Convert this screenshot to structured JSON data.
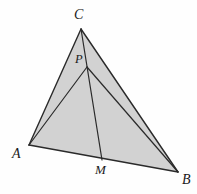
{
  "figure": {
    "kind": "euclidean-geometry-diagram",
    "canvas": {
      "width": 197,
      "height": 194,
      "background": "#fefefe"
    },
    "style": {
      "fill": "#d2d2d2",
      "stroke": "#2a2a2a",
      "stroke_width": 1.4,
      "label_color": "#1a1a1a"
    },
    "points": [
      {
        "id": "C",
        "label": "C",
        "x": 81,
        "y": 29,
        "label_x": 74,
        "label_y": 8,
        "role": "apex-vertex"
      },
      {
        "id": "P",
        "label": "P",
        "x": 87,
        "y": 67,
        "label_x": 75,
        "label_y": 53,
        "role": "interior-point"
      },
      {
        "id": "A",
        "label": "A",
        "x": 29,
        "y": 145,
        "label_x": 12,
        "label_y": 147,
        "role": "left-vertex"
      },
      {
        "id": "M",
        "label": "M",
        "x": 102,
        "y": 160,
        "label_x": 95,
        "label_y": 163,
        "role": "point-on-side-AB"
      },
      {
        "id": "B",
        "label": "B",
        "x": 178,
        "y": 172,
        "label_x": 182,
        "label_y": 173,
        "role": "right-vertex"
      }
    ],
    "polygon": {
      "name": "triangle-ABC",
      "vertices": "29,145 81,29 178,172",
      "filled": true
    },
    "segments": [
      {
        "id": "AC",
        "from": "A",
        "to": "C",
        "x1": 29,
        "y1": 145,
        "x2": 81,
        "y2": 29,
        "kind": "triangle-side"
      },
      {
        "id": "CB",
        "from": "C",
        "to": "B",
        "x1": 81,
        "y1": 29,
        "x2": 178,
        "y2": 172,
        "kind": "triangle-side"
      },
      {
        "id": "AB",
        "from": "A",
        "to": "B",
        "x1": 29,
        "y1": 145,
        "x2": 178,
        "y2": 172,
        "kind": "triangle-side"
      },
      {
        "id": "CM",
        "from": "C",
        "to": "M",
        "x1": 81,
        "y1": 29,
        "x2": 102,
        "y2": 160,
        "kind": "cevian-through-P"
      },
      {
        "id": "PA",
        "from": "P",
        "to": "A",
        "x1": 87,
        "y1": 67,
        "x2": 29,
        "y2": 145,
        "kind": "cevian"
      },
      {
        "id": "PB",
        "from": "P",
        "to": "B",
        "x1": 87,
        "y1": 67,
        "x2": 178,
        "y2": 172,
        "kind": "cevian"
      }
    ]
  }
}
